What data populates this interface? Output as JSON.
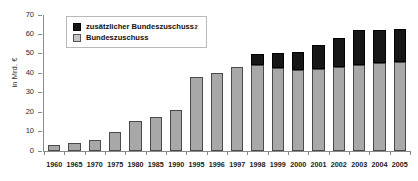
{
  "chart_data": {
    "type": "bar",
    "title": "",
    "subtitle": "",
    "xlabel": "",
    "ylabel": "in Mrd. €",
    "ylim": [
      0,
      70
    ],
    "ytick_step": 10,
    "yticks": [
      "70",
      "60",
      "50",
      "40",
      "30",
      "20",
      "10",
      "0"
    ],
    "grid": false,
    "stacked": true,
    "legend_position": "top-left",
    "categories": [
      "1960",
      "1965",
      "1970",
      "1975",
      "1980",
      "1985",
      "1990",
      "1995",
      "1996",
      "1997",
      "1998",
      "1999",
      "2000",
      "2001",
      "2002",
      "2003",
      "2004",
      "2005"
    ],
    "series": [
      {
        "name": "Bundeszuschuss",
        "color": "#a8a8a8",
        "values": [
          3.0,
          4.2,
          5.5,
          10.0,
          15.3,
          17.5,
          21.0,
          38.2,
          40.2,
          43.0,
          44.5,
          42.5,
          41.5,
          42.0,
          43.0,
          44.5,
          45.5,
          45.8
        ]
      },
      {
        "name": "zusätzlicher Bundeszuschuss",
        "color": "#161616",
        "footnote": "2",
        "values": [
          0,
          0,
          0,
          0,
          0,
          0,
          0,
          0,
          0,
          0,
          5.2,
          8.1,
          9.4,
          12.5,
          15.0,
          18.0,
          17.0,
          17.2
        ]
      }
    ],
    "totals": [
      3.0,
      4.2,
      5.5,
      10.0,
      15.3,
      17.5,
      21.0,
      38.2,
      40.2,
      43.0,
      49.7,
      50.6,
      50.9,
      54.5,
      58.0,
      62.5,
      62.5,
      63.0
    ]
  },
  "legend": {
    "items": [
      {
        "label": "zusätzlicher Bundeszuschuss",
        "superscript": "2",
        "swatch": "extra"
      },
      {
        "label": "Bundeszuschuss",
        "superscript": "",
        "swatch": "base"
      }
    ]
  },
  "axis": {
    "y_title": "in Mrd. €"
  }
}
